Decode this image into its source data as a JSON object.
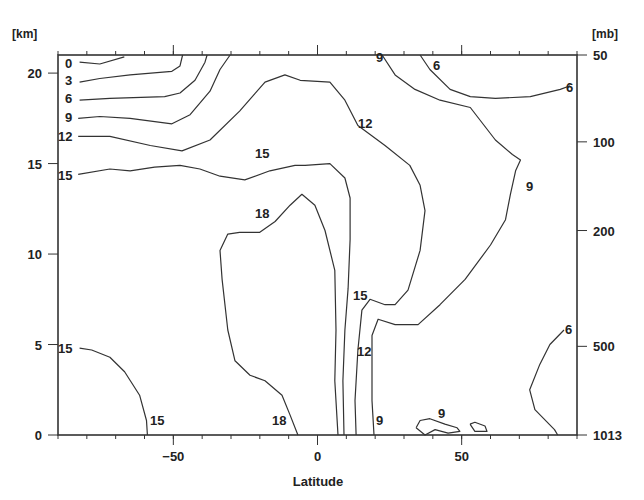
{
  "chart_data": {
    "type": "contour",
    "title": "",
    "xlabel": "Latitude",
    "ylabel_left_unit": "[km]",
    "ylabel_right_unit": "[mb]",
    "xlim": [
      -90,
      90
    ],
    "ylim": [
      0,
      21
    ],
    "x_ticks": [
      {
        "value": -50,
        "label": "−50"
      },
      {
        "value": 0,
        "label": "0"
      },
      {
        "value": 50,
        "label": "50"
      }
    ],
    "y_ticks_left": [
      {
        "value": 0,
        "label": "0"
      },
      {
        "value": 5,
        "label": "5"
      },
      {
        "value": 10,
        "label": "10"
      },
      {
        "value": 15,
        "label": "15"
      },
      {
        "value": 20,
        "label": "20"
      }
    ],
    "y_ticks_right": [
      {
        "km": 21,
        "label": "50"
      },
      {
        "km": 16.2,
        "label": "100"
      },
      {
        "km": 11.3,
        "label": "200"
      },
      {
        "km": 4.9,
        "label": "500"
      },
      {
        "km": 0,
        "label": "1013"
      }
    ],
    "grid": false,
    "contours": [
      {
        "level": 0,
        "label_pos": [
          -88,
          20.5
        ],
        "points": [
          [
            -82.5,
            20.6
          ],
          [
            -75.5,
            20.5
          ],
          [
            -67,
            20.9
          ]
        ]
      },
      {
        "level": 3,
        "label_pos": [
          -88,
          19.6
        ],
        "points": [
          [
            -82.5,
            19.5
          ],
          [
            -75.5,
            19.7
          ],
          [
            -65,
            19.9
          ],
          [
            -50.5,
            20.1
          ],
          [
            -47.7,
            20.4
          ],
          [
            -46.8,
            21
          ]
        ]
      },
      {
        "level": 6,
        "label_pos": [
          -88,
          18.6
        ],
        "points": [
          [
            -82.5,
            18.5
          ],
          [
            -72,
            18.6
          ],
          [
            -53,
            18.7
          ],
          [
            -47.7,
            18.9
          ],
          [
            -42.5,
            19.6
          ],
          [
            -39,
            20.6
          ],
          [
            -38.3,
            21
          ]
        ]
      },
      {
        "level": 9,
        "label_pos": [
          -88,
          17.5
        ],
        "points": [
          [
            -83,
            17.5
          ],
          [
            -75.5,
            17.6
          ],
          [
            -65,
            17.5
          ],
          [
            -50.5,
            17.2
          ],
          [
            -44.2,
            17.7
          ],
          [
            -37.3,
            19
          ],
          [
            -33.8,
            20.2
          ],
          [
            -30.3,
            21
          ]
        ]
      },
      {
        "level": 12,
        "label_pos": [
          -88,
          16.5
        ],
        "points": [
          [
            -83,
            16.5
          ],
          [
            -72,
            16.5
          ],
          [
            -58,
            16
          ],
          [
            -47,
            15.7
          ],
          [
            -37.3,
            16.3
          ],
          [
            -27,
            17.9
          ],
          [
            -18.2,
            19.5
          ],
          [
            -11.3,
            19.9
          ],
          [
            -6,
            19.6
          ],
          [
            4.3,
            19.5
          ],
          [
            9.5,
            18.5
          ],
          [
            14,
            17.1
          ],
          [
            23.4,
            16
          ],
          [
            32,
            14.9
          ],
          [
            35.6,
            13.8
          ],
          [
            37.3,
            12.4
          ],
          [
            35.6,
            10.2
          ],
          [
            31.4,
            8
          ],
          [
            26.9,
            7.2
          ],
          [
            23.4,
            7.2
          ],
          [
            18.2,
            7.5
          ],
          [
            15.4,
            6.9
          ],
          [
            14,
            4.7
          ],
          [
            13,
            1.9
          ],
          [
            13.4,
            0
          ]
        ]
      },
      {
        "level": 15,
        "label_pos": [
          -88,
          14.4
        ],
        "points": [
          [
            -83,
            14.4
          ],
          [
            -72,
            14.7
          ],
          [
            -65,
            14.6
          ],
          [
            -56.5,
            14.8
          ],
          [
            -47.7,
            14.9
          ],
          [
            -40.8,
            14.7
          ],
          [
            -33.8,
            14.3
          ],
          [
            -25.2,
            14.1
          ],
          [
            -16.5,
            14.6
          ],
          [
            -7.8,
            14.9
          ],
          [
            -4.3,
            14.9
          ],
          [
            4.3,
            15
          ],
          [
            9.5,
            14.2
          ],
          [
            11.3,
            13.1
          ],
          [
            11.3,
            10.8
          ],
          [
            10.6,
            8.1
          ],
          [
            9.5,
            5.8
          ],
          [
            8.8,
            3
          ],
          [
            9.2,
            0
          ]
        ]
      },
      {
        "level": 18,
        "label_pos": [
          -20,
          12.4
        ],
        "points": [
          [
            -6.8,
            0
          ],
          [
            -9.5,
            1.1
          ],
          [
            -12.3,
            2.2
          ],
          [
            -18.2,
            3
          ],
          [
            -23.4,
            3.3
          ],
          [
            -28.6,
            4.1
          ],
          [
            -31.1,
            5.8
          ],
          [
            -33.1,
            8.6
          ],
          [
            -33.8,
            10.2
          ],
          [
            -31.1,
            11.1
          ],
          [
            -27,
            11.2
          ],
          [
            -20,
            11.2
          ],
          [
            -14.7,
            11.8
          ],
          [
            -9.5,
            12.7
          ],
          [
            -5.4,
            13.3
          ],
          [
            -0.9,
            12.7
          ],
          [
            2.6,
            11.3
          ],
          [
            6,
            9.1
          ],
          [
            6.4,
            5.8
          ],
          [
            6,
            3
          ],
          [
            7.1,
            0
          ]
        ]
      },
      {
        "level": 15,
        "label_pos": [
          -88,
          4.8
        ],
        "points": [
          [
            -82.5,
            4.8
          ],
          [
            -78.3,
            4.7
          ],
          [
            -72,
            4.3
          ],
          [
            -66.9,
            3.5
          ],
          [
            -61.7,
            2.2
          ],
          [
            -59.3,
            0.8
          ],
          [
            -59,
            0
          ]
        ]
      },
      {
        "level": 9,
        "label_pos": [
          72,
          13.8
        ],
        "points": [
          [
            22.4,
            21
          ],
          [
            26.9,
            19.9
          ],
          [
            33.8,
            19.1
          ],
          [
            42.5,
            18.5
          ],
          [
            53,
            18.1
          ],
          [
            61.7,
            16.3
          ],
          [
            67.6,
            15.5
          ],
          [
            70.4,
            15.2
          ],
          [
            68.7,
            14.6
          ],
          [
            66.9,
            13.3
          ],
          [
            65.2,
            11.9
          ],
          [
            60,
            10.5
          ],
          [
            51.2,
            8.6
          ],
          [
            42.5,
            7.2
          ],
          [
            34.9,
            6.1
          ],
          [
            26.9,
            6.1
          ],
          [
            21,
            6.4
          ],
          [
            18.9,
            5.5
          ],
          [
            18.9,
            1.9
          ],
          [
            19.6,
            0
          ]
        ]
      },
      {
        "level": 6,
        "label_pos": [
          74,
          19.5
        ],
        "points": [
          [
            35.6,
            21
          ],
          [
            39,
            20.2
          ],
          [
            46,
            19.1
          ],
          [
            53,
            18.7
          ],
          [
            61.7,
            18.6
          ],
          [
            73.8,
            18.7
          ],
          [
            84.2,
            19.1
          ],
          [
            87.6,
            19.3
          ]
        ]
      },
      {
        "level": 6,
        "label_pos": [
          83,
          5.6
        ],
        "points": [
          [
            85.5,
            5.8
          ],
          [
            80.6,
            5
          ],
          [
            77.1,
            3.9
          ],
          [
            73.6,
            2.5
          ],
          [
            75.4,
            1.4
          ],
          [
            82.2,
            0.3
          ],
          [
            83.3,
            0
          ]
        ]
      },
      {
        "level": 9,
        "label_pos": [
          43,
          1.2
        ],
        "points": [
          [
            34.2,
            0.4
          ],
          [
            35.6,
            0.8
          ],
          [
            39,
            0.9
          ],
          [
            44.2,
            0.6
          ],
          [
            48.4,
            0.4
          ],
          [
            49.4,
            0.2
          ],
          [
            45.3,
            0.1
          ],
          [
            40.8,
            0.3
          ],
          [
            37.3,
            0
          ],
          [
            34.2,
            0.4
          ]
        ]
      },
      {
        "level": 9,
        "label_pos": null,
        "points": [
          [
            52.9,
            0.6
          ],
          [
            54.6,
            0.7
          ],
          [
            58.1,
            0.5
          ],
          [
            58.8,
            0.2
          ],
          [
            54.6,
            0.2
          ],
          [
            52.9,
            0.6
          ]
        ]
      }
    ],
    "contour_labels": [
      {
        "text": "0",
        "x": 65,
        "y": 68
      },
      {
        "text": "3",
        "x": 65,
        "y": 85
      },
      {
        "text": "6",
        "x": 65,
        "y": 103
      },
      {
        "text": "9",
        "x": 65,
        "y": 122
      },
      {
        "text": "12",
        "x": 58,
        "y": 141
      },
      {
        "text": "15",
        "x": 58,
        "y": 180
      },
      {
        "text": "15",
        "x": 255,
        "y": 158,
        "note": "center 15"
      },
      {
        "text": "12",
        "x": 358,
        "y": 128
      },
      {
        "text": "9",
        "x": 376,
        "y": 62
      },
      {
        "text": "6",
        "x": 433,
        "y": 70
      },
      {
        "text": "6",
        "x": 566,
        "y": 92
      },
      {
        "text": "9",
        "x": 526,
        "y": 191
      },
      {
        "text": "18",
        "x": 255,
        "y": 218
      },
      {
        "text": "15",
        "x": 353,
        "y": 300
      },
      {
        "text": "12",
        "x": 357,
        "y": 356
      },
      {
        "text": "15",
        "x": 58,
        "y": 353
      },
      {
        "text": "15",
        "x": 150,
        "y": 425
      },
      {
        "text": "18",
        "x": 272,
        "y": 425
      },
      {
        "text": "9",
        "x": 376,
        "y": 425
      },
      {
        "text": "9",
        "x": 438,
        "y": 418
      },
      {
        "text": "6",
        "x": 565,
        "y": 334
      }
    ]
  }
}
